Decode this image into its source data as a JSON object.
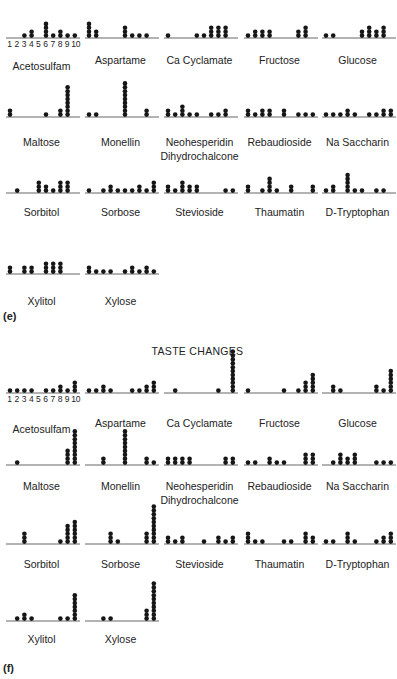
{
  "chart_data": [
    {
      "type": "dot-histogram-grid",
      "panel_tag": "(e)",
      "title": "",
      "x_ticks": [
        "1",
        "2",
        "3",
        "4",
        "5",
        "6",
        "7",
        "8",
        "9",
        "10"
      ],
      "ylabel": "count",
      "charts": [
        {
          "name": "Acetosulfam",
          "values": [
            0,
            0,
            1,
            2,
            0,
            4,
            1,
            2,
            1,
            1
          ]
        },
        {
          "name": "Aspartame",
          "values": [
            4,
            2,
            0,
            0,
            0,
            3,
            1,
            1,
            1,
            0
          ]
        },
        {
          "name": "Ca Cyclamate",
          "values": [
            1,
            0,
            0,
            0,
            1,
            1,
            3,
            3,
            3,
            0
          ]
        },
        {
          "name": "Fructose",
          "values": [
            1,
            2,
            2,
            2,
            0,
            0,
            0,
            2,
            3,
            0
          ]
        },
        {
          "name": "Glucose",
          "values": [
            1,
            1,
            0,
            0,
            0,
            2,
            3,
            2,
            3,
            0
          ]
        },
        {
          "name": "Maltose",
          "values": [
            2,
            0,
            0,
            0,
            0,
            1,
            0,
            2,
            8,
            0
          ]
        },
        {
          "name": "Monellin",
          "values": [
            1,
            1,
            0,
            0,
            0,
            9,
            0,
            0,
            2,
            0
          ]
        },
        {
          "name": "Neohesperidin Dihydrochalcone",
          "values": [
            2,
            1,
            3,
            1,
            1,
            0,
            1,
            1,
            2,
            0
          ]
        },
        {
          "name": "Rebaudioside",
          "values": [
            2,
            1,
            2,
            2,
            0,
            2,
            0,
            1,
            1,
            1
          ]
        },
        {
          "name": "Na Saccharin",
          "values": [
            1,
            1,
            1,
            2,
            1,
            0,
            1,
            1,
            2,
            2
          ]
        },
        {
          "name": "Sorbitol",
          "values": [
            0,
            1,
            0,
            0,
            3,
            2,
            1,
            3,
            3,
            0
          ]
        },
        {
          "name": "Sorbose",
          "values": [
            1,
            0,
            1,
            2,
            1,
            1,
            1,
            2,
            1,
            3
          ]
        },
        {
          "name": "Stevioside",
          "values": [
            2,
            1,
            3,
            2,
            2,
            0,
            0,
            0,
            1,
            1
          ]
        },
        {
          "name": "Thaumatin",
          "values": [
            2,
            0,
            1,
            4,
            1,
            0,
            2,
            0,
            0,
            2
          ]
        },
        {
          "name": "D-Tryptophan",
          "values": [
            1,
            2,
            0,
            5,
            1,
            1,
            0,
            1,
            1,
            0
          ]
        },
        {
          "name": "Xylitol",
          "values": [
            2,
            0,
            2,
            2,
            0,
            3,
            3,
            3,
            0,
            0
          ]
        },
        {
          "name": "Xylose",
          "values": [
            2,
            1,
            1,
            1,
            0,
            1,
            2,
            1,
            2,
            1
          ]
        }
      ]
    },
    {
      "type": "dot-histogram-grid",
      "panel_tag": "(f)",
      "title": "TASTE CHANGES",
      "x_ticks": [
        "1",
        "2",
        "3",
        "4",
        "5",
        "6",
        "7",
        "8",
        "9",
        "10"
      ],
      "ylabel": "count",
      "charts": [
        {
          "name": "Acetosulfam",
          "values": [
            1,
            1,
            1,
            1,
            0,
            1,
            1,
            2,
            1,
            3
          ]
        },
        {
          "name": "Aspartame",
          "values": [
            1,
            1,
            2,
            1,
            0,
            0,
            1,
            1,
            2,
            3
          ]
        },
        {
          "name": "Ca Cyclamate",
          "values": [
            0,
            1,
            0,
            0,
            0,
            0,
            0,
            1,
            0,
            11
          ]
        },
        {
          "name": "Fructose",
          "values": [
            1,
            0,
            0,
            0,
            0,
            1,
            0,
            1,
            3,
            5
          ]
        },
        {
          "name": "Glucose",
          "values": [
            0,
            2,
            1,
            0,
            0,
            0,
            0,
            2,
            1,
            6
          ]
        },
        {
          "name": "Maltose",
          "values": [
            0,
            1,
            0,
            0,
            0,
            0,
            0,
            0,
            4,
            9
          ]
        },
        {
          "name": "Monellin",
          "values": [
            0,
            0,
            2,
            0,
            0,
            9,
            0,
            0,
            2,
            1
          ]
        },
        {
          "name": "Neohesperidin Dihydrochalcone",
          "values": [
            2,
            2,
            2,
            2,
            0,
            0,
            0,
            0,
            2,
            2
          ]
        },
        {
          "name": "Rebaudioside",
          "values": [
            1,
            1,
            0,
            2,
            1,
            1,
            0,
            0,
            3,
            3
          ]
        },
        {
          "name": "Na Saccharin",
          "values": [
            0,
            1,
            3,
            2,
            3,
            0,
            0,
            1,
            1,
            1
          ]
        },
        {
          "name": "Sorbitol",
          "values": [
            0,
            0,
            3,
            0,
            0,
            0,
            0,
            1,
            5,
            6
          ]
        },
        {
          "name": "Sorbose",
          "values": [
            0,
            0,
            0,
            3,
            1,
            0,
            0,
            0,
            3,
            10
          ]
        },
        {
          "name": "Stevioside",
          "values": [
            2,
            1,
            2,
            0,
            0,
            1,
            0,
            2,
            1,
            2
          ]
        },
        {
          "name": "Thaumatin",
          "values": [
            3,
            1,
            1,
            0,
            0,
            1,
            1,
            0,
            3,
            2
          ]
        },
        {
          "name": "D-Tryptophan",
          "values": [
            1,
            1,
            0,
            3,
            1,
            0,
            0,
            1,
            2,
            3
          ]
        },
        {
          "name": "Xylitol",
          "values": [
            0,
            1,
            2,
            1,
            0,
            0,
            0,
            1,
            1,
            7
          ]
        },
        {
          "name": "Xylose",
          "values": [
            0,
            0,
            1,
            1,
            0,
            0,
            0,
            0,
            3,
            10
          ]
        }
      ]
    }
  ]
}
